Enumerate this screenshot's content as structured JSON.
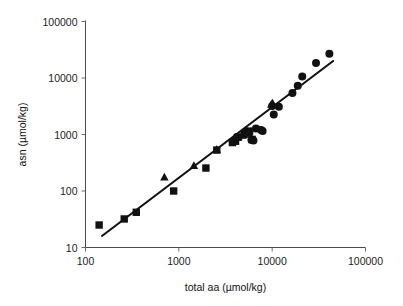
{
  "chart_data": {
    "type": "scatter",
    "title": "",
    "xlabel": "total aa (µmol/kg)",
    "ylabel": "asn (µmol/kg)",
    "xscale": "log",
    "yscale": "log",
    "xlim": [
      100,
      100000
    ],
    "ylim": [
      10,
      100000
    ],
    "xticks": [
      100,
      1000,
      10000,
      100000
    ],
    "xtick_labels": [
      "100",
      "1000",
      "10000",
      "100000"
    ],
    "yticks": [
      10,
      100,
      1000,
      10000,
      100000
    ],
    "ytick_labels": [
      "10",
      "100",
      "1000",
      "10000",
      "100000"
    ],
    "grid": false,
    "legend": false,
    "legend_position": "none",
    "marker_color": "#111111",
    "line_color": "#111111",
    "series": [
      {
        "name": "squares",
        "marker": "square",
        "points": [
          [
            140,
            25
          ],
          [
            260,
            32
          ],
          [
            350,
            42
          ],
          [
            880,
            100
          ],
          [
            1950,
            255
          ],
          [
            2550,
            530
          ],
          [
            3750,
            720
          ],
          [
            4050,
            760
          ],
          [
            4350,
            900
          ],
          [
            5000,
            1000
          ],
          [
            5600,
            1150
          ],
          [
            6100,
            820
          ]
        ]
      },
      {
        "name": "triangles",
        "marker": "triangle",
        "points": [
          [
            700,
            175
          ],
          [
            1450,
            280
          ],
          [
            2550,
            540
          ],
          [
            4200,
            880
          ],
          [
            4800,
            960
          ],
          [
            5300,
            1180
          ],
          [
            9800,
            3400
          ],
          [
            10100,
            3550
          ]
        ]
      },
      {
        "name": "circles",
        "marker": "circle",
        "points": [
          [
            4200,
            900
          ],
          [
            5200,
            1080
          ],
          [
            5700,
            1060
          ],
          [
            6000,
            800
          ],
          [
            6300,
            780
          ],
          [
            6700,
            1280
          ],
          [
            7600,
            1200
          ],
          [
            7900,
            1150
          ],
          [
            10000,
            3200
          ],
          [
            10400,
            2250
          ],
          [
            11800,
            3100
          ],
          [
            16500,
            5400
          ],
          [
            18800,
            7300
          ],
          [
            21000,
            10600
          ],
          [
            29500,
            18500
          ],
          [
            41000,
            27000
          ]
        ]
      }
    ],
    "trendline": {
      "name": "fit",
      "x_start": 150,
      "y_start": 16,
      "x_end": 45000,
      "y_end": 20000
    },
    "annotations": []
  }
}
